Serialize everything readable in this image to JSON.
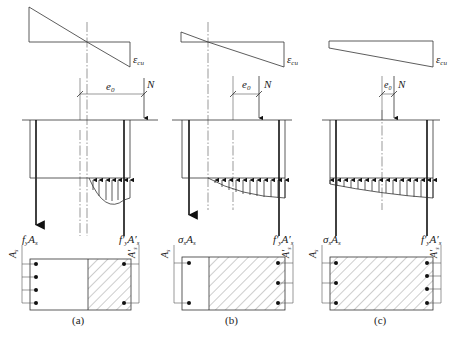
{
  "figure": {
    "panels": [
      {
        "id": "a",
        "caption": "(a)",
        "strain_label": "ε",
        "strain_sub": "cu",
        "eccentricity_label": "e",
        "eccentricity_sub": "0",
        "force_label": "N",
        "tension_label": "f",
        "tension_label_sub": "y",
        "tension_label_area": "A",
        "tension_label_area_sub": "s",
        "compression_label": "f′",
        "compression_label_sub": "y",
        "compression_label_area": "A′",
        "compression_label_area_sub": "s",
        "left_steel_label": "A",
        "left_steel_sub": "s",
        "right_steel_label": "A′",
        "right_steel_sub": "s",
        "left_bars": 4,
        "right_bars": 2,
        "description": "Large eccentric compression: tension steel yields"
      },
      {
        "id": "b",
        "caption": "(b)",
        "strain_label": "ε",
        "strain_sub": "cu",
        "eccentricity_label": "e",
        "eccentricity_sub": "0",
        "force_label": "N",
        "tension_label": "σ",
        "tension_label_sub": "s",
        "tension_label_area": "A",
        "tension_label_area_sub": "s",
        "compression_label": "f′",
        "compression_label_sub": "y",
        "compression_label_area": "A′",
        "compression_label_area_sub": "s",
        "left_steel_label": "A",
        "left_steel_sub": "s",
        "right_steel_label": "A′",
        "right_steel_sub": "s",
        "left_bars": 2,
        "right_bars": 3,
        "description": "Small eccentric compression: partially compressed section"
      },
      {
        "id": "c",
        "caption": "(c)",
        "strain_label": "ε",
        "strain_sub": "cu",
        "eccentricity_label": "e",
        "eccentricity_sub": "0",
        "force_label": "N",
        "tension_label": "σ",
        "tension_label_sub": "s",
        "tension_label_area": "A",
        "tension_label_area_sub": "s",
        "compression_label": "f′",
        "compression_label_sub": "y",
        "compression_label_area": "A′",
        "compression_label_area_sub": "s",
        "left_steel_label": "A",
        "left_steel_sub": "s",
        "right_steel_label": "A′",
        "right_steel_sub": "s",
        "left_bars": 3,
        "right_bars": 4,
        "description": "Small eccentric compression: fully compressed section"
      }
    ]
  }
}
